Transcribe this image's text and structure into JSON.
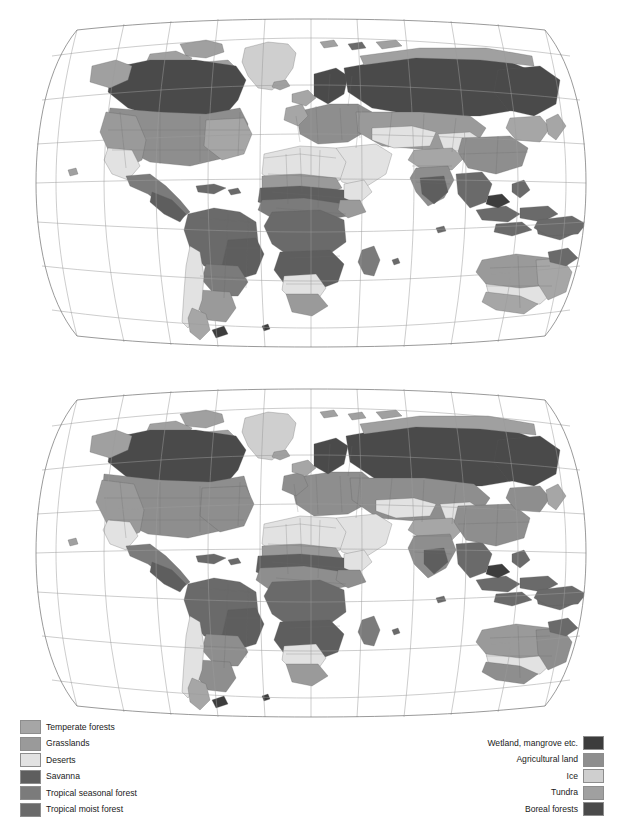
{
  "figure": {
    "type": "two-panel world biome map",
    "panels": [
      {
        "id": "map-top",
        "title": ""
      },
      {
        "id": "map-bottom",
        "title": ""
      }
    ]
  },
  "legend_left": {
    "items": [
      {
        "label": "Temperate forests",
        "color": "#a6a6a6"
      },
      {
        "label": "Grasslands",
        "color": "#9a9a9a"
      },
      {
        "label": "Deserts",
        "color": "#e2e2e2"
      },
      {
        "label": "Savanna",
        "color": "#5e5e5e"
      },
      {
        "label": "Tropical seasonal forest",
        "color": "#7b7b7b"
      },
      {
        "label": "Tropical moist forest",
        "color": "#6a6a6a"
      }
    ]
  },
  "legend_right": {
    "items": [
      {
        "label": "Wetland, mangrove etc.",
        "color": "#3c3c3c"
      },
      {
        "label": "Agricultural land",
        "color": "#8e8e8e"
      },
      {
        "label": "Ice",
        "color": "#cfcfcf"
      },
      {
        "label": "Tundra",
        "color": "#a0a0a0"
      },
      {
        "label": "Boreal forests",
        "color": "#4a4a4a"
      }
    ]
  },
  "map_style": {
    "background": "#ffffff",
    "graticule_color": "#9b9b9b",
    "frame_color": "#6e6e6e",
    "coast_color": "#5a5a5a",
    "projection": "Robinson-like pseudocylindrical"
  }
}
